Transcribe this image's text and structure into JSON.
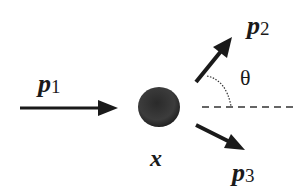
{
  "diagram": {
    "type": "particle-decay-scattering",
    "vectors": {
      "p1": {
        "symbol": "p",
        "subscript": "1",
        "direction": "incoming, horizontal right"
      },
      "p2": {
        "symbol": "p",
        "subscript": "2",
        "direction": "outgoing, up-right"
      },
      "p3": {
        "symbol": "p",
        "subscript": "3",
        "direction": "outgoing, down-right"
      }
    },
    "vertex": {
      "label": "x",
      "shape": "filled-circle"
    },
    "angle": {
      "label": "θ",
      "between": "p2 and horizontal reference (dashed)"
    },
    "colors": {
      "ink": "#1a1a1a",
      "vertex_fill": "#3a3a3a",
      "background": "#ffffff"
    }
  }
}
